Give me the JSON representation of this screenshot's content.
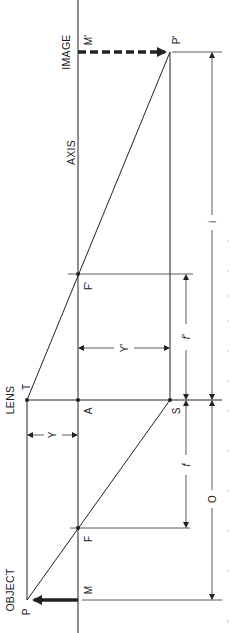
{
  "diagram": {
    "labels": {
      "image": "IMAGE",
      "axis": "AXIS",
      "lens": "LENS",
      "object": "OBJECT"
    },
    "points": {
      "M_prime": "M'",
      "P_prime": "P'",
      "F_prime": "F'",
      "T": "T",
      "A": "A",
      "S": "S",
      "F": "F",
      "M": "M",
      "P": "P"
    },
    "dimensions": {
      "y": "Y",
      "y_prime": "Y'",
      "f": "f",
      "f_prime": "f'",
      "o": "O",
      "i": "i"
    },
    "colors": {
      "line": "#222222",
      "background": "#ffffff"
    }
  }
}
